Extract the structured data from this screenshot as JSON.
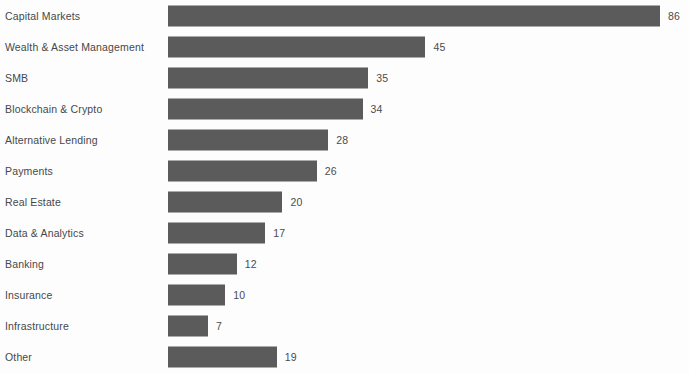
{
  "chart_data": {
    "type": "bar",
    "orientation": "horizontal",
    "title": "",
    "subtitle": "",
    "xlabel": "",
    "ylabel": "",
    "grid": false,
    "legend": null,
    "xlim": [
      0,
      86
    ],
    "bar_color": "#5b5b5b",
    "label_color": "#46484a",
    "background": "#fdfdfd",
    "value_labels_shown": true,
    "axis_ticks_shown": false,
    "categories": [
      "Capital Markets",
      "Wealth & Asset Management",
      "SMB",
      "Blockchain & Crypto",
      "Alternative Lending",
      "Payments",
      "Real Estate",
      "Data & Analytics",
      "Banking",
      "Insurance",
      "Infrastructure",
      "Other"
    ],
    "values": [
      86,
      45,
      35,
      34,
      28,
      26,
      20,
      17,
      12,
      10,
      7,
      19
    ]
  }
}
